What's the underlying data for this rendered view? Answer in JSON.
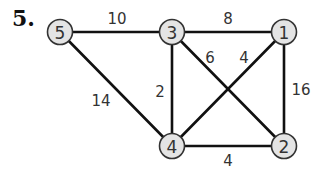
{
  "problem": {
    "number": "5."
  },
  "graph": {
    "nodes": [
      {
        "id": "5",
        "label": "5",
        "x": 60,
        "y": 32
      },
      {
        "id": "3",
        "label": "3",
        "x": 172,
        "y": 32
      },
      {
        "id": "1",
        "label": "1",
        "x": 284,
        "y": 32
      },
      {
        "id": "4",
        "label": "4",
        "x": 172,
        "y": 146
      },
      {
        "id": "2",
        "label": "2",
        "x": 284,
        "y": 146
      }
    ],
    "edges": [
      {
        "from": "5",
        "to": "3",
        "weight": "10",
        "lx": 117,
        "ly": 19
      },
      {
        "from": "3",
        "to": "1",
        "weight": "8",
        "lx": 228,
        "ly": 19
      },
      {
        "from": "3",
        "to": "2",
        "weight": "6",
        "lx": 210,
        "ly": 58
      },
      {
        "from": "1",
        "to": "4",
        "weight": "4",
        "lx": 244,
        "ly": 58
      },
      {
        "from": "3",
        "to": "4",
        "weight": "2",
        "lx": 160,
        "ly": 92
      },
      {
        "from": "5",
        "to": "4",
        "weight": "14",
        "lx": 101,
        "ly": 101
      },
      {
        "from": "1",
        "to": "2",
        "weight": "16",
        "lx": 301,
        "ly": 90
      },
      {
        "from": "4",
        "to": "2",
        "weight": "4",
        "lx": 228,
        "ly": 161
      }
    ]
  },
  "colors": {
    "node_fill": "#e4e4e4",
    "node_stroke": "#333333",
    "edge": "#111111",
    "text": "#333333"
  }
}
